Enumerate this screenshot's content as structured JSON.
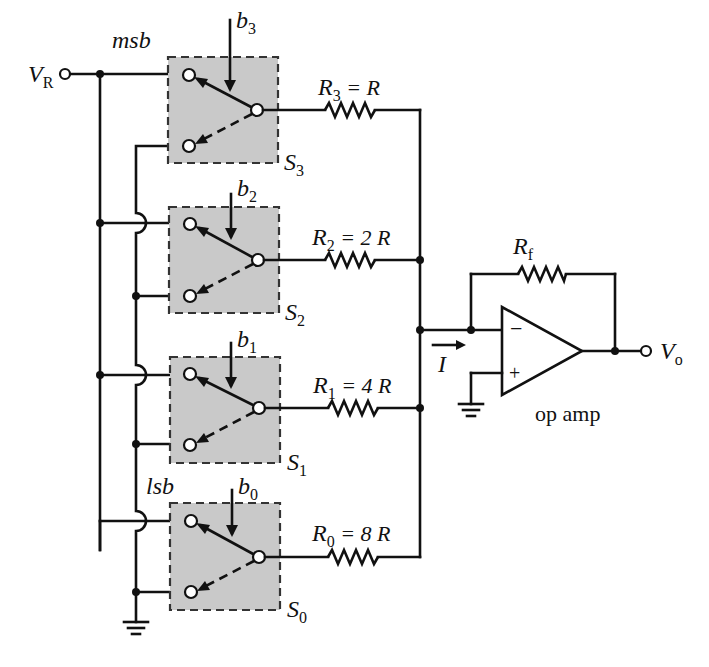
{
  "figure": {
    "colors": {
      "ink": "#111111",
      "switch_fill": "#c9c9c9",
      "background": "#ffffff"
    }
  },
  "labels": {
    "reference_voltage": "V",
    "reference_voltage_sub": "R",
    "output_voltage": "V",
    "output_voltage_sub": "o",
    "msb": "msb",
    "lsb": "lsb",
    "current": "I",
    "op_amp": "op amp",
    "feedback_resistor": "R",
    "feedback_resistor_sub": "f",
    "minus_sign": "−",
    "plus_sign": "+"
  },
  "stages": [
    {
      "bit": "b",
      "bit_sub": "3",
      "switch": "S",
      "switch_sub": "3",
      "resistor": "R",
      "resistor_sub": "3",
      "value": " = R"
    },
    {
      "bit": "b",
      "bit_sub": "2",
      "switch": "S",
      "switch_sub": "2",
      "resistor": "R",
      "resistor_sub": "2",
      "value": " = 2 R"
    },
    {
      "bit": "b",
      "bit_sub": "1",
      "switch": "S",
      "switch_sub": "1",
      "resistor": "R",
      "resistor_sub": "1",
      "value": " = 4 R"
    },
    {
      "bit": "b",
      "bit_sub": "0",
      "switch": "S",
      "switch_sub": "0",
      "resistor": "R",
      "resistor_sub": "0",
      "value": " = 8 R"
    }
  ]
}
